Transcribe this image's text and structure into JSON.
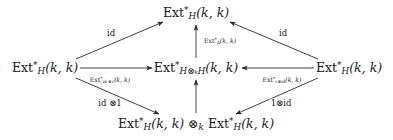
{
  "diagram": {
    "kind": "commutative-diagram",
    "canvas": {
      "width": 393,
      "height": 140
    },
    "ink_color": "#2b2b2b",
    "background_color": "#ffffff",
    "nodes": [
      {
        "id": "top",
        "name": "node-top-ext-h",
        "text": "Ext*_H(k, k)",
        "display": "Ext",
        "sup": "*",
        "sub": "H",
        "args": "(k, k)",
        "x": 196,
        "y": 13
      },
      {
        "id": "left",
        "name": "node-left-ext-h",
        "text": "Ext*_H(k, k)",
        "display": "Ext",
        "sup": "*",
        "sub": "H",
        "args": "(k, k)",
        "x": 45,
        "y": 68
      },
      {
        "id": "center",
        "name": "node-center-ext-h-tensor-h",
        "text": "Ext*_{H⊗_k H}(k, k)",
        "display": "Ext",
        "sup": "*",
        "sub": "H⊗ₖH",
        "args": "(k, k)",
        "x": 196,
        "y": 68
      },
      {
        "id": "right",
        "name": "node-right-ext-h",
        "text": "Ext*_H(k, k)",
        "display": "Ext",
        "sup": "*",
        "sub": "H",
        "args": "(k, k)",
        "x": 349,
        "y": 68
      },
      {
        "id": "bottom",
        "name": "node-bottom-ext-tensor-ext",
        "text": "Ext*_H(k, k) ⊗_k Ext*_H(k, k)",
        "display": "Ext",
        "sup": "*",
        "sub": "H",
        "args": "(k, k)",
        "tensor": "⊗",
        "tensor_sub": "k",
        "x": 196,
        "y": 124
      }
    ],
    "edges": [
      {
        "id": "left-to-top",
        "name": "arrow-left-to-top-id",
        "from": "left",
        "to": "top",
        "label": "id",
        "label_size": "big",
        "label_x": 111,
        "label_y": 33
      },
      {
        "id": "right-to-top",
        "name": "arrow-right-to-top-id",
        "from": "right",
        "to": "top",
        "label": "id",
        "label_size": "big",
        "label_x": 283,
        "label_y": 33
      },
      {
        "id": "center-to-top",
        "name": "arrow-center-to-top-ext-delta",
        "from": "center",
        "to": "top",
        "label": "Ext*_Δ(k, k)",
        "label_size": "vert",
        "label_x": 218,
        "label_y": 41,
        "label_prefix": "Ext",
        "label_sup": "*",
        "label_sub": "Δ",
        "label_args": "(k, k)"
      },
      {
        "id": "left-to-center",
        "name": "arrow-left-to-center-ext-id-eps",
        "from": "left",
        "to": "center",
        "label": "Ext*_{id ⊗ ε}(k, k)",
        "label_size": "small",
        "label_x": 110,
        "label_y": 80,
        "label_prefix": "Ext",
        "label_sup": "*",
        "label_sub": "id ⊗ε",
        "label_args": "(k, k)"
      },
      {
        "id": "right-to-center",
        "name": "arrow-right-to-center-ext-eps-id",
        "from": "right",
        "to": "center",
        "label": "Ext*_{ε⊗id}(k, k)",
        "label_size": "small",
        "label_x": 282,
        "label_y": 80,
        "label_prefix": "Ext",
        "label_sup": "*",
        "label_sub": "ε⊗id",
        "label_args": "(k, k)"
      },
      {
        "id": "left-to-bottom",
        "name": "arrow-left-to-bottom-id-tensor-one",
        "from": "left",
        "to": "bottom",
        "label": "id ⊗1",
        "label_size": "big",
        "label_x": 110,
        "label_y": 103
      },
      {
        "id": "right-to-bottom",
        "name": "arrow-right-to-bottom-one-tensor-id",
        "from": "right",
        "to": "bottom",
        "label": "1⊗id",
        "label_size": "big",
        "label_x": 281,
        "label_y": 103
      },
      {
        "id": "bottom-to-center",
        "name": "arrow-bottom-to-center",
        "from": "bottom",
        "to": "center",
        "label": "",
        "label_size": "vert",
        "label_x": 196,
        "label_y": 97
      }
    ]
  }
}
